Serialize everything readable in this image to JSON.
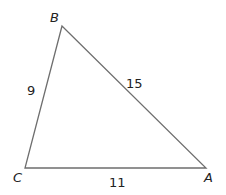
{
  "diagram": {
    "type": "triangle",
    "vertices": {
      "B": {
        "label": "B",
        "x": 62,
        "y": 26
      },
      "C": {
        "label": "C",
        "x": 25,
        "y": 168
      },
      "A": {
        "label": "A",
        "x": 206,
        "y": 168
      }
    },
    "sides": {
      "BC": {
        "label": "9"
      },
      "AB": {
        "label": "15"
      },
      "CA": {
        "label": "11"
      }
    },
    "stroke_color": "#6e6e6e"
  }
}
